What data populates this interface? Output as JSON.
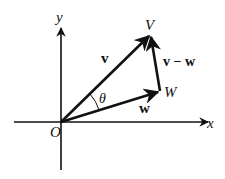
{
  "diagram": {
    "type": "vector-diagram",
    "colors": {
      "ink": "#111111",
      "background": "#ffffff"
    },
    "axes": {
      "x_label": "x",
      "y_label": "y",
      "origin_label": "O"
    },
    "points": {
      "V": "V",
      "W": "W"
    },
    "vectors": {
      "v": "v",
      "w": "w",
      "v_minus_w": "v − w"
    },
    "angle_label": "θ"
  }
}
